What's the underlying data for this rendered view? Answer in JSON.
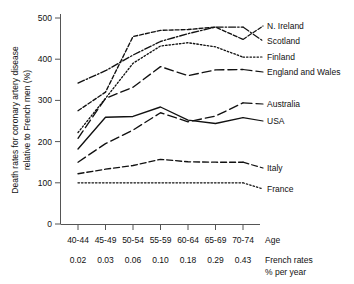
{
  "chart_data": {
    "type": "line",
    "title": "",
    "ylabel": "Death rates for coronary artery disease relative to French men (%)",
    "ylabel_line1": "Death rates for coronary artery disease",
    "ylabel_line2": "relative to French men (%)",
    "xlabel": "Age",
    "x_secondary_label_line1": "French rates",
    "x_secondary_label_line2": "% per year",
    "categories": [
      "40-44",
      "45-49",
      "50-54",
      "55-59",
      "60-64",
      "65-69",
      "70-74"
    ],
    "x_secondary_ticks": [
      "0.02",
      "0.03",
      "0.06",
      "0.10",
      "0.18",
      "0.29",
      "0.43"
    ],
    "ylim": [
      0,
      500
    ],
    "yticks": [
      0,
      100,
      200,
      300,
      400,
      500
    ],
    "ytick_labels": [
      "0",
      "100",
      "200",
      "300",
      "400",
      "500"
    ],
    "grid": false,
    "legend": "right-inline-labels",
    "series": [
      {
        "name": "N. Ireland",
        "style": "short-dash",
        "dasharray": "4,2",
        "color": "#111111",
        "values": [
          275,
          320,
          455,
          470,
          472,
          478,
          448
        ]
      },
      {
        "name": "Scotland",
        "style": "dash-dot",
        "dasharray": "7,2,1.5,2",
        "color": "#111111",
        "values": [
          342,
          372,
          410,
          443,
          462,
          478,
          478
        ]
      },
      {
        "name": "Finland",
        "style": "dotted",
        "dasharray": "1.5,2",
        "color": "#111111",
        "values": [
          222,
          305,
          390,
          432,
          440,
          430,
          405
        ]
      },
      {
        "name": "England and Wales",
        "style": "long-dash",
        "dasharray": "9,4",
        "color": "#111111",
        "values": [
          208,
          305,
          332,
          382,
          360,
          374,
          375
        ]
      },
      {
        "name": "Australia",
        "style": "long-dash",
        "dasharray": "9,4",
        "color": "#111111",
        "values": [
          150,
          195,
          228,
          270,
          248,
          262,
          294
        ]
      },
      {
        "name": "USA",
        "style": "solid",
        "dasharray": "",
        "color": "#111111",
        "values": [
          182,
          259,
          261,
          284,
          252,
          244,
          258
        ]
      },
      {
        "name": "Italy",
        "style": "medium-dash",
        "dasharray": "6,3",
        "color": "#111111",
        "values": [
          122,
          133,
          142,
          157,
          151,
          150,
          150
        ]
      },
      {
        "name": "France",
        "style": "dotted",
        "dasharray": "1.5,2",
        "color": "#111111",
        "values": [
          100,
          100,
          100,
          100,
          100,
          100,
          100
        ]
      }
    ]
  },
  "axes": {
    "y_axis_name": "y-axis",
    "x_axis_name": "x-axis"
  }
}
